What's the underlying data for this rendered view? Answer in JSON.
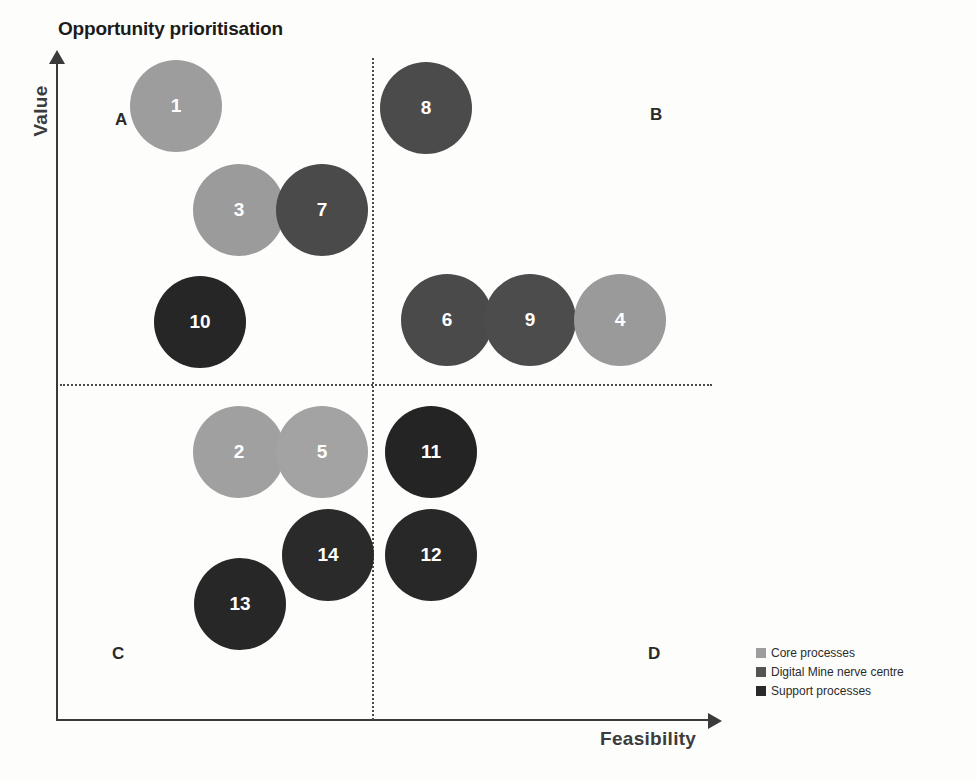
{
  "chart_data": {
    "type": "scatter",
    "title": "Opportunity prioritisation",
    "xlabel": "Feasibility",
    "ylabel": "Value",
    "grid": false,
    "legend_position": "bottom-right",
    "xlim": [
      0,
      100
    ],
    "ylim": [
      0,
      100
    ],
    "quadrants": [
      {
        "key": "A",
        "label": "A",
        "x": 115,
        "y": 110
      },
      {
        "key": "B",
        "label": "B",
        "x": 650,
        "y": 105
      },
      {
        "key": "C",
        "label": "C",
        "x": 112,
        "y": 644
      },
      {
        "key": "D",
        "label": "D",
        "x": 648,
        "y": 644
      }
    ],
    "divider_x": 372,
    "divider_y": 384,
    "categories": [
      {
        "key": "core",
        "name": "Core processes",
        "color": "#9d9d9d"
      },
      {
        "key": "nerve",
        "name": "Digital Mine nerve centre",
        "color": "#4e4e4e"
      },
      {
        "key": "support",
        "name": "Support processes",
        "color": "#272727"
      }
    ],
    "points": [
      {
        "id": "1",
        "label": "1",
        "cx": 176,
        "cy": 106,
        "r": 46,
        "category": "core",
        "color": "#9d9d9d",
        "quadrant": "A"
      },
      {
        "id": "3",
        "label": "3",
        "cx": 239,
        "cy": 210,
        "r": 46,
        "category": "core",
        "color": "#9b9b9b",
        "quadrant": "A"
      },
      {
        "id": "7",
        "label": "7",
        "cx": 322,
        "cy": 210,
        "r": 46,
        "category": "nerve",
        "color": "#4a4a4a",
        "quadrant": "A"
      },
      {
        "id": "10",
        "label": "10",
        "cx": 200,
        "cy": 322,
        "r": 46,
        "category": "support",
        "color": "#262626",
        "quadrant": "A"
      },
      {
        "id": "8",
        "label": "8",
        "cx": 426,
        "cy": 108,
        "r": 46,
        "category": "nerve",
        "color": "#4b4b4b",
        "quadrant": "B"
      },
      {
        "id": "6",
        "label": "6",
        "cx": 447,
        "cy": 320,
        "r": 46,
        "category": "nerve",
        "color": "#4a4a4a",
        "quadrant": "B"
      },
      {
        "id": "9",
        "label": "9",
        "cx": 530,
        "cy": 320,
        "r": 46,
        "category": "nerve",
        "color": "#4c4c4c",
        "quadrant": "B"
      },
      {
        "id": "4",
        "label": "4",
        "cx": 620,
        "cy": 320,
        "r": 46,
        "category": "core",
        "color": "#9a9a9a",
        "quadrant": "B"
      },
      {
        "id": "2",
        "label": "2",
        "cx": 239,
        "cy": 452,
        "r": 46,
        "category": "core",
        "color": "#a0a0a0",
        "quadrant": "C"
      },
      {
        "id": "5",
        "label": "5",
        "cx": 322,
        "cy": 452,
        "r": 46,
        "category": "core",
        "color": "#a3a3a3",
        "quadrant": "C"
      },
      {
        "id": "14",
        "label": "14",
        "cx": 328,
        "cy": 555,
        "r": 46,
        "category": "support",
        "color": "#2a2a2a",
        "quadrant": "C"
      },
      {
        "id": "13",
        "label": "13",
        "cx": 240,
        "cy": 604,
        "r": 46,
        "category": "support",
        "color": "#272727",
        "quadrant": "C"
      },
      {
        "id": "11",
        "label": "11",
        "cx": 431,
        "cy": 452,
        "r": 46,
        "category": "support",
        "color": "#242424",
        "quadrant": "D"
      },
      {
        "id": "12",
        "label": "12",
        "cx": 431,
        "cy": 555,
        "r": 46,
        "category": "support",
        "color": "#282828",
        "quadrant": "D"
      }
    ]
  },
  "legend": {
    "items": [
      {
        "label": "Core processes",
        "color": "#9d9d9d"
      },
      {
        "label": "Digital Mine nerve centre",
        "color": "#545454"
      },
      {
        "label": "Support processes",
        "color": "#2a2a2a"
      }
    ]
  }
}
